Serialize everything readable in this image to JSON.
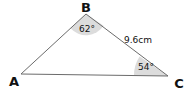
{
  "diagram": {
    "type": "triangle",
    "vertices": {
      "A": {
        "label": "A"
      },
      "B": {
        "label": "B"
      },
      "C": {
        "label": "C"
      }
    },
    "angles": {
      "B": "62°",
      "C": "54°"
    },
    "sides": {
      "BC": "9.6cm"
    },
    "colors": {
      "line": "#6b6b6b",
      "angle_fill": "#dcdcdc",
      "text": "#111111"
    }
  }
}
